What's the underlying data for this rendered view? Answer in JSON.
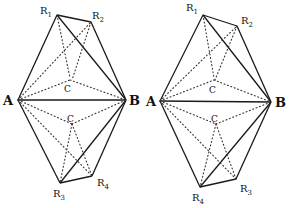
{
  "figures": [
    {
      "name": "left",
      "labels": {
        "A": "A",
        "B": "B",
        "R1": "R",
        "R1_sub": "1",
        "R2": "R",
        "R2_sub": "2",
        "R3": "R",
        "R3_sub": "3",
        "R4": "R",
        "R4_sub": "4",
        "C_upper": "C",
        "C_lower": "C"
      }
    },
    {
      "name": "right",
      "labels": {
        "A": "A",
        "B": "B",
        "R1": "R",
        "R1_sub": "1",
        "R2": "R",
        "R2_sub": "2",
        "R3": "R",
        "R3_sub": "3",
        "R4": "R",
        "R4_sub": "4",
        "C_upper": "C",
        "C_lower": "C"
      }
    }
  ],
  "colors": {
    "line": "#1a1a1a",
    "background": "#ffffff"
  }
}
